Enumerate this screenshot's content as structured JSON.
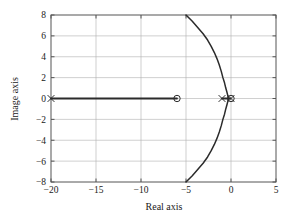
{
  "chart_data": {
    "type": "line",
    "title": "",
    "subtitle": "",
    "xlabel": "Real axis",
    "ylabel": "Image axis",
    "xlim": [
      -20,
      5
    ],
    "ylim": [
      -8,
      8
    ],
    "xticks": [
      -20,
      -15,
      -10,
      -5,
      0,
      5
    ],
    "xtick_labels": [
      "−20",
      "−15",
      "−10",
      "−5",
      "0",
      "5"
    ],
    "yticks": [
      -8,
      -6,
      -4,
      -2,
      0,
      2,
      4,
      6,
      8
    ],
    "ytick_labels": [
      "−8",
      "−6",
      "−4",
      "−2",
      "0",
      "2",
      "4",
      "6",
      "8"
    ],
    "grid": true,
    "grid_color": "#b0b0b0",
    "axes_color": "#555555",
    "curve_color": "#2b2b2b",
    "legend": null,
    "legend_position": "none",
    "annotations": [],
    "series": [
      {
        "name": "real-axis-locus-left",
        "type": "segment",
        "comment": "Locus segment on the real axis from pole at -20 to zero at -6",
        "points": [
          [
            -20,
            0
          ],
          [
            -6,
            0
          ]
        ]
      },
      {
        "name": "real-axis-locus-right",
        "type": "segment",
        "comment": "Short locus segment on real axis between pole at -1 and breakaway near -0.3",
        "points": [
          [
            -1,
            0
          ],
          [
            -0.1,
            0
          ]
        ]
      },
      {
        "name": "complex-branch",
        "type": "curve",
        "comment": "Parabola-like complex branch opening left, vertex near -0.3 + 0j, crossing the frame at Re = -5 for Im = ±8",
        "points": [
          [
            -5.0,
            8.0
          ],
          [
            -4.3,
            7.4
          ],
          [
            -3.7,
            6.8
          ],
          [
            -3.1,
            6.2
          ],
          [
            -2.6,
            5.6
          ],
          [
            -2.2,
            5.0
          ],
          [
            -1.85,
            4.4
          ],
          [
            -1.55,
            3.8
          ],
          [
            -1.3,
            3.2
          ],
          [
            -1.08,
            2.6
          ],
          [
            -0.9,
            2.0
          ],
          [
            -0.72,
            1.5
          ],
          [
            -0.58,
            1.0
          ],
          [
            -0.45,
            0.6
          ],
          [
            -0.36,
            0.3
          ],
          [
            -0.31,
            0.0
          ],
          [
            -0.36,
            -0.3
          ],
          [
            -0.45,
            -0.6
          ],
          [
            -0.58,
            -1.0
          ],
          [
            -0.72,
            -1.5
          ],
          [
            -0.9,
            -2.0
          ],
          [
            -1.08,
            -2.6
          ],
          [
            -1.3,
            -3.2
          ],
          [
            -1.55,
            -3.8
          ],
          [
            -1.85,
            -4.4
          ],
          [
            -2.2,
            -5.0
          ],
          [
            -2.6,
            -5.6
          ],
          [
            -3.1,
            -6.2
          ],
          [
            -3.7,
            -6.8
          ],
          [
            -4.3,
            -7.4
          ],
          [
            -5.0,
            -8.0
          ]
        ]
      }
    ],
    "markers": [
      {
        "symbol": "x",
        "name": "pole",
        "label": "pole-at-minus-20",
        "x": -20,
        "y": 0
      },
      {
        "symbol": "o",
        "name": "zero",
        "label": "zero-at-minus-6",
        "x": -6,
        "y": 0
      },
      {
        "symbol": "x",
        "name": "pole",
        "label": "pole-at-minus-1",
        "x": -1,
        "y": 0
      },
      {
        "symbol": "x",
        "name": "pole",
        "label": "pole-at-origin",
        "x": 0,
        "y": 0
      },
      {
        "symbol": "o",
        "name": "zero",
        "label": "zero-at-origin",
        "x": 0,
        "y": 0
      }
    ]
  }
}
